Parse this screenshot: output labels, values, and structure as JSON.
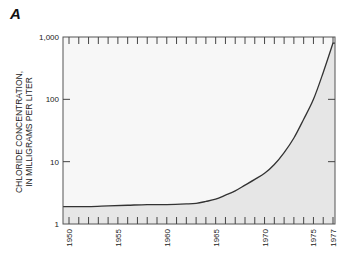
{
  "panel_label": "A",
  "chart_data": {
    "type": "area",
    "title": "",
    "xlabel": "",
    "ylabel_lines": [
      "CHLORIDE CONCENTRATION,",
      "IN MILLIGRAMS PER LITER"
    ],
    "yscale": "log",
    "ylim": [
      1,
      1000
    ],
    "xlim": [
      1950,
      1977
    ],
    "y_ticks": [
      1,
      10,
      100,
      1000
    ],
    "y_tick_labels": [
      "1",
      "10",
      "100",
      "1,000"
    ],
    "x_tick_labels": [
      "1950",
      "1955",
      "1960",
      "1965",
      "1970",
      "1975",
      "1977"
    ],
    "x_tick_values": [
      1950,
      1955,
      1960,
      1965,
      1970,
      1975,
      1977
    ],
    "grid": false,
    "fill_color": "#e6e6e6",
    "line_color": "#333333",
    "x": [
      1950,
      1952,
      1954,
      1956,
      1958,
      1960,
      1962,
      1963,
      1964,
      1965,
      1966,
      1967,
      1968,
      1969,
      1970,
      1971,
      1972,
      1973,
      1974,
      1975,
      1976,
      1977
    ],
    "values": [
      1.9,
      1.9,
      1.95,
      2.0,
      2.05,
      2.05,
      2.1,
      2.15,
      2.3,
      2.5,
      2.9,
      3.4,
      4.2,
      5.2,
      6.5,
      9,
      14,
      24,
      48,
      100,
      270,
      800
    ]
  }
}
